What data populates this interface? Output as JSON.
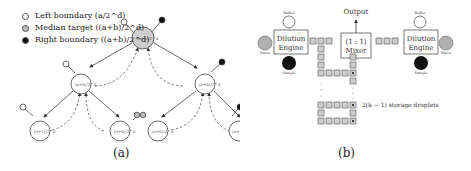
{
  "panel_a": {
    "caption": "(a)",
    "legend": [
      {
        "label": "Left boundary (a/2^d)",
        "color": "#ffffff"
      },
      {
        "label": "Median target ((a+b)/2^d)",
        "color": "#bbbbbb"
      },
      {
        "label": "Right boundary ((a+b)/2^d)",
        "color": "#111111"
      }
    ],
    "nodes": {
      "root": "(a+b)/2^d",
      "l1_left": "(a+b)/2^d",
      "l1_right": "(a+b)/2^d",
      "l2_1": "(a+1)/2^d",
      "l2_2": "(a+b)/2^d",
      "l2_3": "(a+b)/2^d",
      "l2_4": "(a+1)/2^d"
    }
  },
  "panel_b": {
    "caption": "(b)",
    "output_label": "Output",
    "mixer_label_line1": "(1 : 1)",
    "mixer_label_line2": "Mixer",
    "left_engine": {
      "line1": "Dilution",
      "line2": "Engine",
      "buffer": "Buffer",
      "waste": "Waste",
      "sample": "Sample"
    },
    "right_engine": {
      "line1": "Dilution",
      "line2": "Engine",
      "buffer": "Buffer",
      "waste": "Waste",
      "sample": "Sample"
    },
    "storage_annotation": "2(k − 1) storage droplets",
    "colors": {
      "cell_fill": "#cccccc",
      "cell_stroke": "#555555",
      "waste": "#b0b0b0",
      "sample": "#111111"
    }
  }
}
